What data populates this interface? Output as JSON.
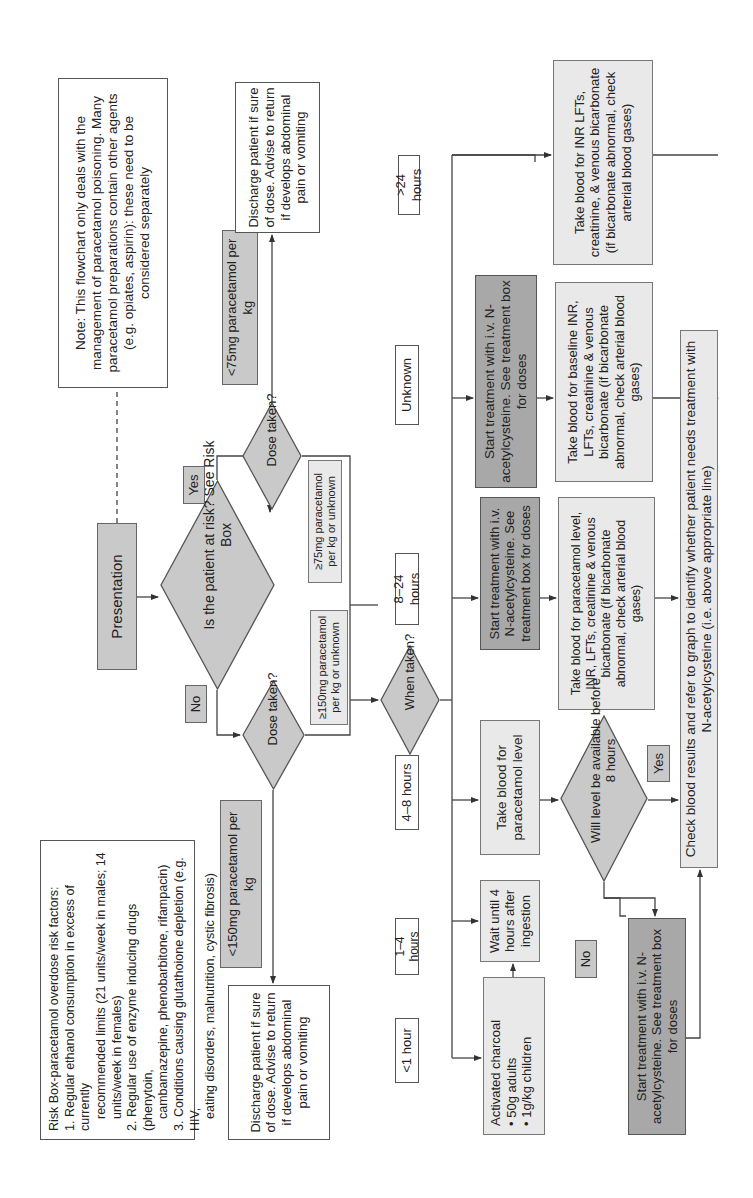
{
  "colors": {
    "line": "#444444",
    "box_dark": "#a8a8a8",
    "box_mid": "#c9c9c9",
    "box_light": "#e9e9e9",
    "box_white": "#ffffff"
  },
  "orientation": "rotated-90-ccw",
  "risk_box": {
    "title": "Risk Box-paracetamol overdose risk factors:",
    "lines": [
      "1.  Regular ethanol consumption in excess of currently",
      "recommended limits (21 units/week in males; 14",
      "units/week in females)",
      "2.  Regular use of enzyme inducing drugs (phenytoin,",
      "cambamazepine, phenobarbitone, rifampacin)",
      "3.  Conditions causing glutathoione depletion (e.g. HIV,",
      "eating disorders, malnutrition, cystic fibrosis)"
    ]
  },
  "note_box": {
    "text": "Note:  This flowchart only deals with the management of paracetamol poisoning. Many paracetamol preparations contain other agents (e.g. opiates, aspirin): these need to be considered separately"
  },
  "nodes": {
    "presentation": "Presentation",
    "at_risk": "Is the patient at risk? See Risk Box",
    "yes_label": "Yes",
    "no_label": "No",
    "dose_taken_at_risk": "Dose taken?",
    "dose_taken_not_at_risk": "Dose taken?",
    "lt75": "<75mg paracetamol per kg",
    "ge75": "≥75mg paracetamol per kg or unknown",
    "lt150": "<150mg paracetamol per kg",
    "ge150": "≥150mg paracetamol per kg or unknown",
    "discharge_top": "Discharge patient if sure of dose. Advise to return if develops abdominal pain or vomiting",
    "discharge_bottom": "Discharge patient if sure of dose. Advise to return if develops abdominal pain or vomiting",
    "when_taken": "When taken?",
    "time_labels": {
      "lt1": "<1 hour",
      "h1_4": "1–4 hours",
      "h4_8": "4–8 hours",
      "h8_24": "8–24 hours",
      "unknown": "Unknown",
      "gt24": ">24 hours"
    },
    "activated_charcoal": {
      "title": "Activated charcoal",
      "bullets": [
        "50g adults",
        "1g/kg children"
      ]
    },
    "wait_4h": "Wait until 4 hours after ingestion",
    "take_blood_paracetamol": "Take blood for paracetamol level",
    "start_nac_8_24": "Start treatment with i.v. N-acetylcysteine. See treatment box for doses",
    "start_nac_unknown": "Start treatment with i.v. N-acetylcysteine. See treatment box for doses",
    "blood_8_24": "Take blood for paracetamol level, INR, LFTs, creatinine & venous bicarbonate (if bicarbonate abnormal, check arterial blood gases)",
    "blood_unknown": "Take blood for baseline INR, LFTs, creatinine & venous bicarbonate (if bicarbonate abnormal, check arterial blood gases)",
    "blood_gt24": "Take blood for INR LFTs, creatinine, & venous bicarbonate (if bicarbonate abnormal, check arterial blood gases)",
    "will_level": "Will level be available before 8 hours",
    "yes_label_2": "Yes",
    "no_label_2": "No",
    "start_nac_no": "Start treatment with i.v. N-acetylcysteine. See treatment box for doses",
    "check_results": "Check blood results and refer to graph to identify whether patient needs treatment with N-acetylcysteine (i.e. above appropriate line)"
  }
}
